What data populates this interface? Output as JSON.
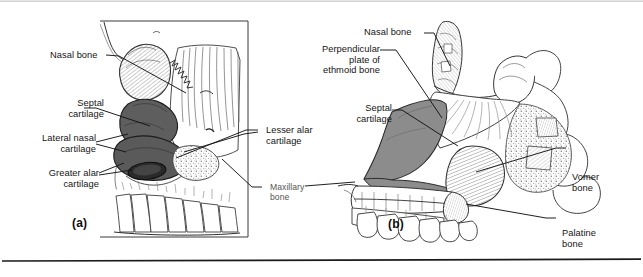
{
  "figure": {
    "panels": [
      {
        "id": "a",
        "caption": "(a)"
      },
      {
        "id": "b",
        "caption": "(b)"
      }
    ]
  },
  "panel_a": {
    "caption": "(a)",
    "labels": [
      {
        "key": "nasal_bone",
        "text": "Nasal bone"
      },
      {
        "key": "septal_cartilage",
        "text": "Septal\ncartilage"
      },
      {
        "key": "lateral_nasal",
        "text": "Lateral nasal\ncartilage"
      },
      {
        "key": "greater_alar",
        "text": "Greater alar\ncartilage"
      },
      {
        "key": "lesser_alar",
        "text": "Lesser alar\ncartilage"
      },
      {
        "key": "maxillary_bone",
        "text": "Maxillary\nbone"
      }
    ]
  },
  "panel_b": {
    "caption": "(b)",
    "labels": [
      {
        "key": "nasal_bone",
        "text": "Nasal bone"
      },
      {
        "key": "perpendicular_plate",
        "text": "Perpendicular\nplate of\nethmoid bone"
      },
      {
        "key": "septal_cartilage",
        "text": "Septal\ncartilage"
      },
      {
        "key": "vomer_bone",
        "text": "Vomer\nbone"
      },
      {
        "key": "palatine_bone",
        "text": "Palatine\nbone"
      }
    ]
  },
  "colors": {
    "ink": "#141414",
    "light_label": "#555555",
    "cartilage_dark": "#5e5e5e",
    "cartilage_mid": "#8c8c8c",
    "bone_fill": "#ffffff",
    "hatch": "#6e6e6e",
    "rule": "#1b1b1b",
    "background": "#ffffff"
  }
}
